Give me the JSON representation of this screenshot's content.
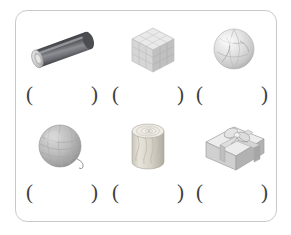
{
  "worksheet": {
    "frame": {
      "border_color": "#c9c9c9",
      "background": "#ffffff"
    },
    "open_paren": "(",
    "close_paren": ")",
    "rows": [
      {
        "cells": [
          {
            "object_name": "cylinder-tube",
            "object_label": "tilted dark gray cylindrical tube",
            "answer": "",
            "open_paren": "(",
            "close_paren": ")"
          },
          {
            "object_name": "cube",
            "object_label": "light gray grid cube",
            "answer": "",
            "open_paren": "(",
            "close_paren": ")"
          },
          {
            "object_name": "sphere-globe",
            "object_label": "light gray globe sphere",
            "answer": "",
            "open_paren": "(",
            "close_paren": ")"
          }
        ]
      },
      {
        "cells": [
          {
            "object_name": "yarn-ball-sphere",
            "object_label": "gray ball of yarn with loose thread",
            "answer": "",
            "open_paren": "(",
            "close_paren": ")"
          },
          {
            "object_name": "wooden-log-cylinder",
            "object_label": "wooden log cylinder with grain",
            "answer": "",
            "open_paren": "(",
            "close_paren": ")"
          },
          {
            "object_name": "gift-box-cuboid",
            "object_label": "gift box cuboid with ribbon and bow",
            "answer": "",
            "open_paren": "(",
            "close_paren": ")"
          }
        ]
      }
    ]
  },
  "colors": {
    "frame_border": "#c9c9c9",
    "paren_ink": "#3d3d3d",
    "tube_dark": "#54565a",
    "tube_light": "#9a9ca0",
    "cube_light": "#e2e2e2",
    "cube_mid": "#cdcdcd",
    "cube_dark": "#b5b5b5",
    "sphere_light": "#e8e8e8",
    "sphere_mid": "#cfcfcf",
    "yarn_mid": "#b9b9b9",
    "yarn_dark": "#8f8f8f",
    "wood_light": "#e0ded6",
    "wood_mid": "#cbc7ba",
    "gift_light": "#e6e6e6",
    "gift_mid": "#c8c8c8",
    "gift_dark": "#a8a8a8"
  }
}
